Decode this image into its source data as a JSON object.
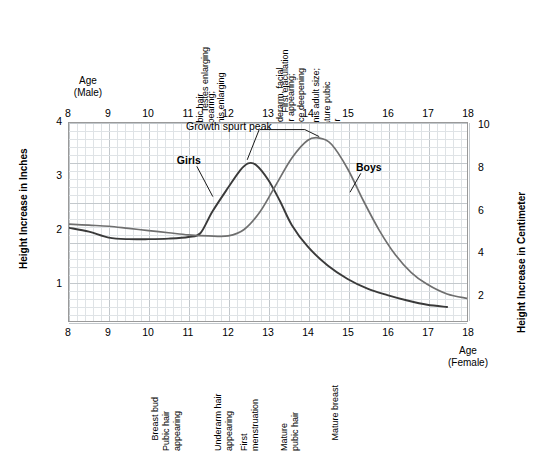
{
  "chart_data": {
    "type": "line",
    "title": "",
    "xlabel_top": "Age\n(Male)",
    "xlabel_bottom": "Age\n(Female)",
    "ylabel_left": "Height Increase in Inches",
    "ylabel_right": "Height Increase in Centimeter",
    "x": [
      8,
      9,
      10,
      11,
      12,
      13,
      14,
      15,
      16,
      17,
      18
    ],
    "xlim": [
      8,
      18
    ],
    "ylim_inches": [
      0.3,
      4
    ],
    "ylim_cm": [
      0.76,
      10.16
    ],
    "yticks_left": [
      1,
      2,
      3,
      4
    ],
    "yticks_right": [
      2,
      4,
      6,
      8,
      10
    ],
    "xticks": [
      "8",
      "9",
      "10",
      "11",
      "12",
      "13",
      "14",
      "15",
      "16",
      "17",
      "18"
    ],
    "grid": true,
    "legend_position": "inline-annotations",
    "series": [
      {
        "name": "Girls",
        "color": "#3a3a3a",
        "points": [
          [
            8.0,
            2.05
          ],
          [
            8.5,
            1.98
          ],
          [
            9.0,
            1.87
          ],
          [
            9.5,
            1.84
          ],
          [
            10.0,
            1.84
          ],
          [
            10.5,
            1.85
          ],
          [
            11.0,
            1.88
          ],
          [
            11.3,
            1.95
          ],
          [
            11.6,
            2.35
          ],
          [
            12.0,
            2.8
          ],
          [
            12.3,
            3.12
          ],
          [
            12.5,
            3.25
          ],
          [
            12.7,
            3.22
          ],
          [
            13.0,
            2.95
          ],
          [
            13.3,
            2.55
          ],
          [
            13.6,
            2.1
          ],
          [
            14.0,
            1.7
          ],
          [
            14.5,
            1.35
          ],
          [
            15.0,
            1.1
          ],
          [
            15.5,
            0.92
          ],
          [
            16.0,
            0.8
          ],
          [
            16.5,
            0.7
          ],
          [
            17.0,
            0.62
          ],
          [
            17.5,
            0.58
          ]
        ]
      },
      {
        "name": "Boys",
        "color": "#6f6f6f",
        "points": [
          [
            8.0,
            2.12
          ],
          [
            8.5,
            2.1
          ],
          [
            9.0,
            2.08
          ],
          [
            9.5,
            2.04
          ],
          [
            10.0,
            2.0
          ],
          [
            10.5,
            1.96
          ],
          [
            11.0,
            1.92
          ],
          [
            11.5,
            1.9
          ],
          [
            12.0,
            1.9
          ],
          [
            12.4,
            2.02
          ],
          [
            12.8,
            2.35
          ],
          [
            13.2,
            2.85
          ],
          [
            13.6,
            3.35
          ],
          [
            14.0,
            3.68
          ],
          [
            14.3,
            3.72
          ],
          [
            14.6,
            3.6
          ],
          [
            15.0,
            3.15
          ],
          [
            15.4,
            2.55
          ],
          [
            15.8,
            2.0
          ],
          [
            16.2,
            1.55
          ],
          [
            16.6,
            1.22
          ],
          [
            17.0,
            1.0
          ],
          [
            17.5,
            0.82
          ],
          [
            18.0,
            0.74
          ]
        ]
      }
    ],
    "annotations": [
      {
        "text": "Growth spurt peak",
        "x": 12.55,
        "y": 3.28
      },
      {
        "text": "Girls",
        "x": 11.0,
        "y": 3.22
      },
      {
        "text": "Boys",
        "x": 15.5,
        "y": 3.08
      }
    ],
    "male_milestones": [
      {
        "label": "Testes enlarging",
        "age": 11.6
      },
      {
        "label": "Pubic hair\nappearing;\npenis enlarging",
        "age": 12.0
      },
      {
        "label": "First ejaculation",
        "age": 13.6
      },
      {
        "label": "Underarm, facial\nhair appearing;\nvoice deepening",
        "age": 14.0
      },
      {
        "label": "Penis adult size;\nmature pubic\nhair",
        "age": 14.9
      }
    ],
    "female_milestones": [
      {
        "label": "Breast bud",
        "age": 10.35
      },
      {
        "label": "Pubic hair\nappearing",
        "age": 10.9
      },
      {
        "label": "Underarm hair\nappearing",
        "age": 12.2
      },
      {
        "label": "First\nmenstruation",
        "age": 12.85
      },
      {
        "label": "Mature\npubic hair",
        "age": 13.85
      },
      {
        "label": "Mature breast",
        "age": 14.85
      }
    ]
  },
  "colors": {
    "girls": "#3a3a3a",
    "boys": "#6f6f6f",
    "grid_minor": "#dfe3e6",
    "grid_major": "#c3c8cc",
    "frame": "#9a9a9a",
    "text": "#000000"
  }
}
